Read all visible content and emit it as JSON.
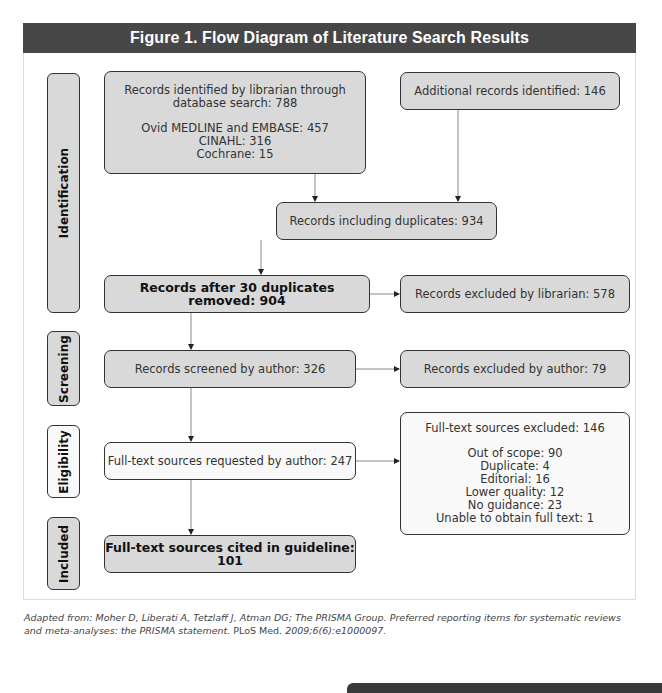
{
  "figure": {
    "title": "Figure 1.  Flow Diagram of Literature Search Results"
  },
  "phases": {
    "identification": "Identification",
    "screening": "Screening",
    "eligibility": "Eligibility",
    "included": "Included"
  },
  "boxes": {
    "librarian_search": {
      "line1": "Records identified by librarian through",
      "line2": "database search: 788",
      "sources": [
        "Ovid MEDLINE and EMBASE: 457",
        "CINAHL: 316",
        "Cochrane: 15"
      ]
    },
    "additional": "Additional records identified: 146",
    "including_duplicates": "Records including duplicates: 934",
    "after_duplicates": "Records after 30 duplicates removed: 904",
    "excluded_librarian": "Records excluded by librarian: 578",
    "screened_author": "Records screened by author: 326",
    "excluded_author": "Records excluded by author: 79",
    "fulltext_requested": "Full-text sources requested by author: 247",
    "fulltext_excluded": {
      "heading": "Full-text sources excluded: 146",
      "reasons": [
        "Out of scope: 90",
        "Duplicate: 4",
        "Editorial: 16",
        "Lower quality: 12",
        "No guidance: 23",
        "Unable to obtain full text: 1"
      ]
    },
    "cited": "Full-text sources cited in guideline: 101"
  },
  "caption": {
    "part1": "Adapted from: Moher D, Liberati A, Tetzlaff J, Atman DG; The PRISMA Group. Preferred reporting items for systematic reviews and meta-analyses: the PRISMA statement. ",
    "journal": "PLoS Med.",
    "part2": " 2009;6(6):e1000097."
  },
  "colors": {
    "header_bg": "#474747",
    "box_gray": "#d9d9d9",
    "box_light": "#f9f9f9",
    "border": "#333333"
  }
}
